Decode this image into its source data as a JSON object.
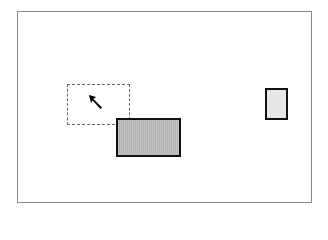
{
  "canvas": {
    "background": "#ffffff",
    "frame_border_color": "#8a8a8a"
  },
  "shapes": [
    {
      "id": "selection-marquee",
      "type": "dashed-rectangle",
      "x": 67,
      "y": 84,
      "w": 63,
      "h": 41,
      "stroke": "#6a6a6a"
    },
    {
      "id": "gray-rectangle",
      "type": "filled-rectangle",
      "x": 116,
      "y": 118,
      "w": 65,
      "h": 39,
      "fill": "#b4b4b4",
      "stroke": "#111111"
    },
    {
      "id": "dotted-rectangle",
      "type": "stippled-rectangle",
      "x": 265,
      "y": 88,
      "w": 23,
      "h": 32,
      "fill": "#e6e6e6",
      "stroke": "#111111"
    }
  ],
  "cursor": {
    "icon": "arrow-pointer-icon",
    "x": 89,
    "y": 95
  }
}
